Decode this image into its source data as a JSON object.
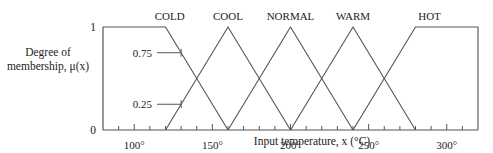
{
  "chart_data": {
    "type": "line",
    "title": "",
    "xlabel": "Input temperature, x (°C)",
    "ylabel_lines": [
      "Degree of",
      "membership, μ(x)"
    ],
    "xlim": [
      80,
      320
    ],
    "ylim": [
      0,
      1
    ],
    "x_tick_step": 10,
    "x_tick_labels": [
      {
        "value": 100,
        "label": "100°"
      },
      {
        "value": 150,
        "label": "150°"
      },
      {
        "value": 200,
        "label": "200°"
      },
      {
        "value": 250,
        "label": "250°"
      },
      {
        "value": 300,
        "label": "300°"
      }
    ],
    "y_tick_labels": [
      {
        "value": 0,
        "label": "0"
      },
      {
        "value": 1,
        "label": "1"
      }
    ],
    "annotations": [
      {
        "label": "0.75",
        "x": 130,
        "y": 0.75
      },
      {
        "label": "0.25",
        "x": 130,
        "y": 0.25
      }
    ],
    "grid": false,
    "legend": "inline labels above curves",
    "series": [
      {
        "name": "COLD",
        "points": [
          [
            80,
            1
          ],
          [
            120,
            1
          ],
          [
            160,
            0
          ]
        ],
        "label_x": 115
      },
      {
        "name": "COOL",
        "points": [
          [
            120,
            0
          ],
          [
            160,
            1
          ],
          [
            200,
            0
          ]
        ],
        "label_x": 160
      },
      {
        "name": "NORMAL",
        "points": [
          [
            160,
            0
          ],
          [
            200,
            1
          ],
          [
            240,
            0
          ]
        ],
        "label_x": 200
      },
      {
        "name": "WARM",
        "points": [
          [
            200,
            0
          ],
          [
            240,
            1
          ],
          [
            280,
            0
          ]
        ],
        "label_x": 240
      },
      {
        "name": "HOT",
        "points": [
          [
            240,
            0
          ],
          [
            280,
            1
          ],
          [
            320,
            1
          ],
          [
            320,
            0
          ]
        ],
        "label_x": 280
      }
    ]
  }
}
